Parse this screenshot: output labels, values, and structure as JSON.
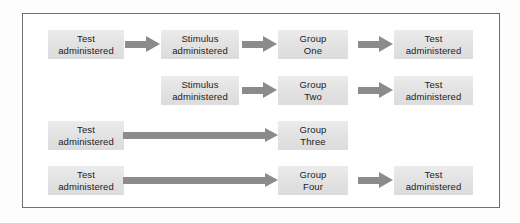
{
  "figure": {
    "type": "flow-diagram",
    "title": "",
    "frame": {
      "border_color": "#6e6e6e",
      "background": "#ffffff"
    },
    "colors": {
      "node_fill": "#e3e3e3",
      "node_text": "#1c1c1c",
      "arrow": "#8b8b8b",
      "frame_border": "#6e6e6e",
      "page_background": "#fdfdfd"
    }
  },
  "rows": [
    {
      "id": "row-group-one",
      "nodes": [
        {
          "id": "r1-pretest",
          "line1": "Test",
          "line2": "administered"
        },
        {
          "id": "r1-stimulus",
          "line1": "Stimulus",
          "line2": "administered"
        },
        {
          "id": "r1-group",
          "line1": "Group",
          "line2": "One"
        },
        {
          "id": "r1-posttest",
          "line1": "Test",
          "line2": "administered"
        }
      ],
      "arrows": [
        "r1-arrow-1",
        "r1-arrow-2",
        "r1-arrow-3"
      ]
    },
    {
      "id": "row-group-two",
      "nodes": [
        {
          "id": "r2-stimulus",
          "line1": "Stimulus",
          "line2": "administered"
        },
        {
          "id": "r2-group",
          "line1": "Group",
          "line2": "Two"
        },
        {
          "id": "r2-posttest",
          "line1": "Test",
          "line2": "administered"
        }
      ],
      "arrows": [
        "r2-arrow-1",
        "r2-arrow-2"
      ]
    },
    {
      "id": "row-group-three",
      "nodes": [
        {
          "id": "r3-pretest",
          "line1": "Test",
          "line2": "administered"
        },
        {
          "id": "r3-group",
          "line1": "Group",
          "line2": "Three"
        }
      ],
      "arrows": [
        "r3-arrow-long"
      ]
    },
    {
      "id": "row-group-four",
      "nodes": [
        {
          "id": "r4-pretest",
          "line1": "Test",
          "line2": "administered"
        },
        {
          "id": "r4-group",
          "line1": "Group",
          "line2": "Four"
        },
        {
          "id": "r4-posttest",
          "line1": "Test",
          "line2": "administered"
        }
      ],
      "arrows": [
        "r4-arrow-long",
        "r4-arrow-2"
      ]
    }
  ]
}
